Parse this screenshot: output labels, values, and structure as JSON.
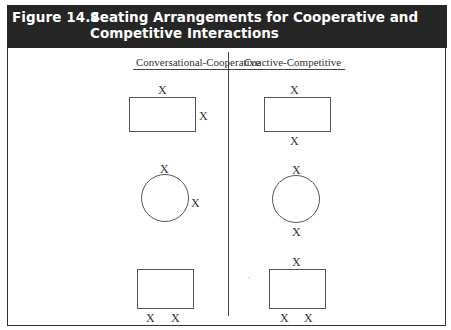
{
  "figure": {
    "number": "Figure 14.4",
    "title": "Seating Arrangements for Cooperative and Competitive Interactions"
  },
  "columns": [
    {
      "label": "Conversational-Cooperative"
    },
    {
      "label": "Coactive-Competitive"
    }
  ],
  "seat_marker": "X",
  "arrangements": {
    "cooperative": [
      {
        "table": "rectangle",
        "seats": [
          "top",
          "right-side"
        ]
      },
      {
        "table": "circle",
        "seats": [
          "top",
          "right-side"
        ]
      },
      {
        "table": "rectangle",
        "seats": [
          "bottom-left",
          "bottom-right"
        ]
      }
    ],
    "competitive": [
      {
        "table": "rectangle",
        "seats": [
          "top",
          "bottom"
        ]
      },
      {
        "table": "circle",
        "seats": [
          "top",
          "bottom"
        ]
      },
      {
        "table": "rectangle",
        "seats": [
          "top",
          "bottom-left",
          "bottom-right"
        ]
      }
    ]
  },
  "colors": {
    "header_bg": "#262626",
    "header_text": "#ffffff",
    "line": "#444444"
  }
}
